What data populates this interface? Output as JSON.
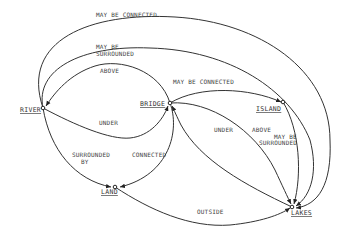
{
  "diagram": {
    "nodes": {
      "river": "RIVER",
      "bridge": "BRIDGE",
      "island": "ISLAND",
      "land": "LAND",
      "lakes": "LAKES"
    },
    "edges": {
      "river_lakes_connected_1": "MAY BE CONNECTED",
      "river_lakes_surrounded_1": "MAY BE",
      "river_lakes_surrounded_2": "SURROUNDED",
      "bridge_river_above": "ABOVE",
      "river_bridge_under": "UNDER",
      "bridge_island_connected": "MAY BE CONNECTED",
      "lakes_bridge_under": "UNDER",
      "bridge_lakes_above": "ABOVE",
      "island_lakes_surrounded_1": "MAY BE",
      "island_lakes_surrounded_2": "SURROUNDED",
      "river_land_surrounded_1": "SURROUNDED",
      "river_land_surrounded_2": "BY",
      "bridge_land_connected": "CONNECTED",
      "land_lakes_outside": "OUTSIDE"
    },
    "colors": {
      "line": "#333333",
      "text": "#444444",
      "background": "#ffffff"
    }
  }
}
